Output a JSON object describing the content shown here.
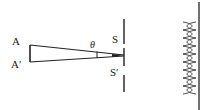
{
  "diagram": {
    "type": "double-slit-interference",
    "colors": {
      "background": "#ffffff",
      "ink": "#222222"
    },
    "labels": {
      "source_top": "A",
      "source_bottom": "A′",
      "angle": "θ",
      "slit_top": "S",
      "slit_bottom": "S′"
    },
    "elements": [
      "source segment AA′",
      "rays from A and A′ converging toward slit screen with angle θ",
      "slit screen with slits S and S′",
      "observation screen with interference fringe pattern"
    ]
  }
}
